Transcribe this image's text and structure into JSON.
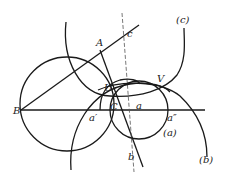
{
  "figure": {
    "type": "geometric-construction",
    "stroke_color": "#1a1a1a",
    "background": "#ffffff"
  },
  "labels": {
    "A": "A",
    "B": "B",
    "C": "C",
    "U": "U",
    "V": "V",
    "a": "a",
    "a_prime": "a′",
    "a_double_prime": "a″",
    "b": "b",
    "c": "c",
    "curve_a": "(a)",
    "curve_b": "(b)",
    "curve_c": "(c)"
  }
}
